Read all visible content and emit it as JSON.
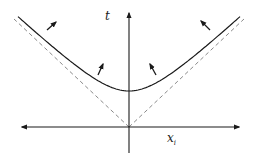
{
  "diagram": {
    "title": "",
    "axes": {
      "vertical_label": "t",
      "horizontal_label": "x",
      "horizontal_subscript": "i"
    },
    "colors": {
      "curve": "#1a1a1a",
      "asymptote": "#8a8a8a",
      "axis": "#1a1a1a",
      "arrow": "#1a1a1a"
    },
    "elements": [
      {
        "type": "hyperbola",
        "description": "spacelike hyperboloid opening upward, vertex above origin"
      },
      {
        "type": "dashed-lines",
        "description": "light cone asymptotes through origin"
      },
      {
        "type": "arrows",
        "count": 4,
        "description": "normal vectors pointing outward from curve"
      }
    ]
  }
}
